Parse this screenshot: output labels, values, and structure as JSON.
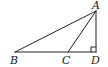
{
  "figure": {
    "type": "geometry-triangle",
    "points": {
      "A": {
        "label": "A",
        "x": 96,
        "y": 11
      },
      "B": {
        "label": "B",
        "x": 15,
        "y": 52
      },
      "C": {
        "label": "C",
        "x": 68,
        "y": 52
      },
      "D": {
        "label": "D",
        "x": 96,
        "y": 52
      }
    },
    "segments": [
      "AB",
      "AC",
      "AD",
      "BD"
    ],
    "right_angle_at": "D",
    "stroke_color": "#222222"
  }
}
